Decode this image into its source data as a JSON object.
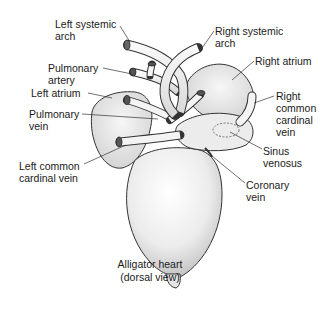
{
  "figure": {
    "title": "Alligator heart",
    "subtitle": "(dorsal view)",
    "caption": "Alligator heart\n(dorsal view)"
  },
  "labels": {
    "left_systemic_arch": "Left systemic\narch",
    "pulmonary_artery": "Pulmonary\nartery",
    "left_atrium": "Left atrium",
    "pulmonary_vein": "Pulmonary\nvein",
    "left_common_cardinal_vein": "Left common\ncardinal vein",
    "right_systemic_arch": "Right systemic\narch",
    "right_atrium": "Right atrium",
    "right_common_cardinal_vein": "Right\ncommon\ncardinal\nvein",
    "sinus_venosus": "Sinus\nvenosus",
    "coronary_vein": "Coronary\nvein"
  },
  "colors": {
    "background": "#ffffff",
    "ink": "#1a1a1a",
    "tissue_fill": "#efefef",
    "tissue_shade": "#d6d6d6"
  }
}
